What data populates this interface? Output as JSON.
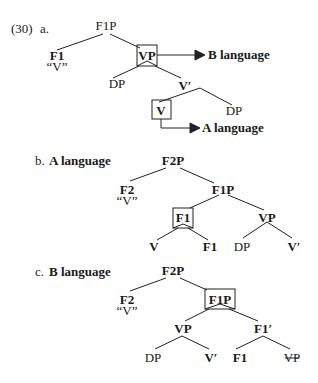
{
  "example_number": "(30)",
  "a": {
    "label": "a.",
    "nodes": {
      "F1P": "F1P",
      "F1": "F1",
      "F1_gloss": "“V”",
      "VP": "VP",
      "DP": "DP",
      "V_bar": "V′",
      "V": "V",
      "DP2": "DP"
    },
    "arrows": {
      "vp_target": "B language",
      "v_target": "A language"
    }
  },
  "b": {
    "label": "b.",
    "title": "A language",
    "nodes": {
      "F2P": "F2P",
      "F2": "F2",
      "F2_gloss": "“V”",
      "F1P": "F1P",
      "F1_boxed": "F1",
      "VP": "VP",
      "V": "V",
      "F1": "F1",
      "DP": "DP",
      "V_bar": "V′"
    }
  },
  "c": {
    "label": "c.",
    "title": "B language",
    "nodes": {
      "F2P": "F2P",
      "F2": "F2",
      "F2_gloss": "“V”",
      "F1P_boxed": "F1P",
      "VP": "VP",
      "F1_bar": "F1′",
      "DP": "DP",
      "V_bar": "V′",
      "F1": "F1",
      "VP_trace": "VP"
    }
  }
}
